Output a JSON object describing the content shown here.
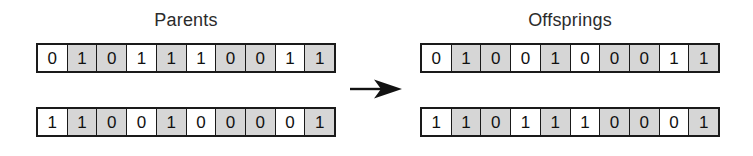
{
  "diagram": {
    "title_left": "Parents",
    "title_right": "Offsprings",
    "arrow_icon": "arrow-right-icon"
  },
  "chart_data": {
    "type": "table",
    "groups": [
      {
        "label": "Parents",
        "rows": [
          {
            "name": "parent-1",
            "genes": [
              "0",
              "1",
              "0",
              "1",
              "1",
              "1",
              "0",
              "0",
              "1",
              "1"
            ],
            "shaded": [
              false,
              true,
              true,
              false,
              true,
              false,
              true,
              true,
              false,
              true
            ]
          },
          {
            "name": "parent-2",
            "genes": [
              "1",
              "1",
              "0",
              "0",
              "1",
              "0",
              "0",
              "0",
              "0",
              "1"
            ],
            "shaded": [
              false,
              true,
              true,
              false,
              true,
              false,
              true,
              true,
              false,
              true
            ]
          }
        ]
      },
      {
        "label": "Offsprings",
        "rows": [
          {
            "name": "offspring-1",
            "genes": [
              "0",
              "1",
              "0",
              "0",
              "1",
              "0",
              "0",
              "0",
              "1",
              "1"
            ],
            "shaded": [
              false,
              true,
              true,
              false,
              true,
              false,
              true,
              true,
              false,
              true
            ]
          },
          {
            "name": "offspring-2",
            "genes": [
              "1",
              "1",
              "0",
              "1",
              "1",
              "1",
              "0",
              "0",
              "0",
              "1"
            ],
            "shaded": [
              false,
              true,
              true,
              false,
              true,
              false,
              true,
              true,
              false,
              true
            ]
          }
        ]
      }
    ],
    "colors": {
      "shaded_cell": "#d6d6d6",
      "plain_cell": "#ffffff",
      "border": "#1a1a1a",
      "text": "#111111"
    }
  }
}
